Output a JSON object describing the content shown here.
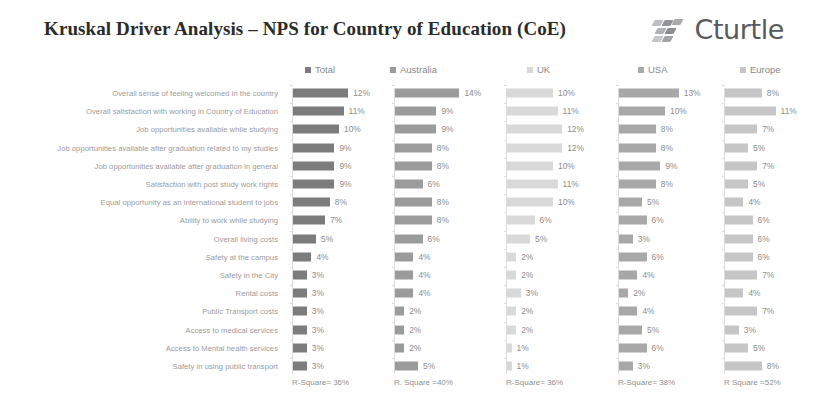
{
  "header": {
    "title": "Kruskal Driver Analysis – NPS for Country of Education (CoE)",
    "logo_text": "Cturtle",
    "logo_icon": "diamond-cluster-icon"
  },
  "colors": {
    "total": "#7c7c7c",
    "australia": "#9b9b9b",
    "uk": "#d9d9d9",
    "usa": "#a8a8a8",
    "europe": "#c6c6c6",
    "label_text": "#9a9a9a",
    "value_text": "#8d8d8d",
    "axis": "#dcdcdc",
    "title_text": "#2b2b2b",
    "background": "#ffffff"
  },
  "chart_data": {
    "type": "bar",
    "title": "Kruskal Driver Analysis – NPS for Country of Education (CoE)",
    "xlabel": "",
    "ylabel": "",
    "grid": false,
    "legend_position": "top",
    "value_suffix": "%",
    "xlim": [
      0,
      14
    ],
    "categories": [
      "Overall sense of feeling welcomed in the country",
      "Overall satisfaction with working in Country of Education",
      "Job opportunities available while studying",
      "Job opportunities available after graduation related to my studies",
      "Job opportunities available after graduation in general",
      "Satisfaction with post study work rights",
      "Equal opportunity as an international student to jobs",
      "Ability to work while studying",
      "Overall living costs",
      "Safety at the campus",
      "Safety in the City",
      "Rental costs",
      "Public Transport costs",
      "Access to medical services",
      "Access to Mental health services",
      "Safety in using public transport"
    ],
    "series": [
      {
        "name": "Total",
        "color": "#7c7c7c",
        "r_square_label": "R-Square= 36%",
        "values": [
          12,
          11,
          10,
          9,
          9,
          9,
          8,
          7,
          5,
          4,
          3,
          3,
          3,
          3,
          3,
          3
        ]
      },
      {
        "name": "Australia",
        "color": "#9b9b9b",
        "r_square_label": "R. Square =40%",
        "values": [
          14,
          9,
          9,
          8,
          8,
          6,
          8,
          8,
          6,
          4,
          4,
          4,
          2,
          2,
          2,
          5
        ]
      },
      {
        "name": "UK",
        "color": "#d9d9d9",
        "r_square_label": "R-Square= 36%",
        "values": [
          10,
          11,
          12,
          12,
          10,
          11,
          10,
          6,
          5,
          2,
          2,
          3,
          2,
          2,
          1,
          1
        ]
      },
      {
        "name": "USA",
        "color": "#a8a8a8",
        "r_square_label": "R-Square= 38%",
        "values": [
          13,
          10,
          8,
          8,
          9,
          8,
          5,
          6,
          3,
          6,
          4,
          2,
          4,
          5,
          6,
          3
        ]
      },
      {
        "name": "Europe",
        "color": "#c6c6c6",
        "r_square_label": "R Square =52%",
        "values": [
          8,
          11,
          7,
          5,
          7,
          5,
          4,
          6,
          6,
          6,
          7,
          4,
          7,
          3,
          5,
          8
        ]
      }
    ]
  },
  "layout": {
    "panel_lefts": [
      292,
      394,
      506,
      618,
      724
    ],
    "panel_scale": [
      4.6,
      4.6,
      4.6,
      4.6,
      4.6
    ],
    "legend_lefts": [
      305,
      390,
      527,
      638,
      740
    ],
    "row_start": 7,
    "row_step": 18.2,
    "label_right": 288
  }
}
